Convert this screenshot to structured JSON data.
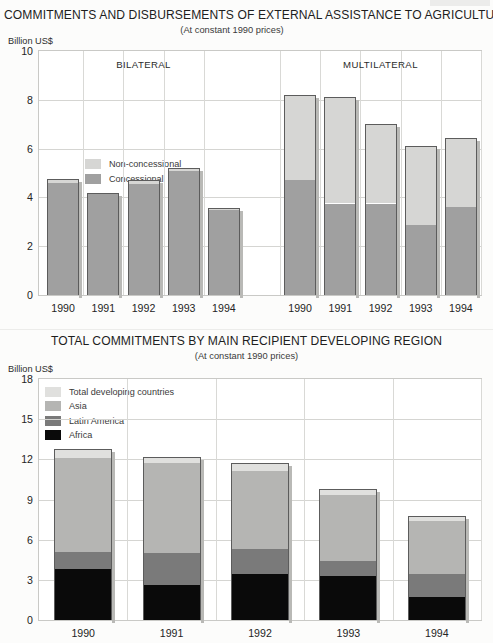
{
  "colors": {
    "non_concessional": "#d6d6d4",
    "concessional": "#a0a0a0",
    "total_developing": "#e0e0de",
    "asia": "#b5b5b3",
    "latin_america": "#7a7a7a",
    "africa": "#0a0a0a",
    "outline": "#5c5c5c",
    "grid": "#d5d5d2",
    "plot_border": "#c9c9c6"
  },
  "chart_data": [
    {
      "type": "bar",
      "title": "COMMITMENTS AND DISBURSEMENTS OF EXTERNAL ASSISTANCE TO AGRICULTURE*",
      "subtitle": "(At constant 1990 prices)",
      "ylabel": "Billion US$",
      "xlabel": "",
      "ylim": [
        0,
        10
      ],
      "yticks": [
        0,
        2,
        4,
        6,
        8,
        10
      ],
      "ytick_labels": [
        "0",
        "2",
        "4",
        "6",
        "8",
        "10"
      ],
      "grid": true,
      "legend_position": "inside-top-left",
      "stacked": true,
      "group_labels": [
        "BILATERAL",
        "MULTILATERAL"
      ],
      "categories": [
        "1990",
        "1991",
        "1992",
        "1993",
        "1994",
        "1990",
        "1991",
        "1992",
        "1993",
        "1994"
      ],
      "series": [
        {
          "name": "Concessional",
          "color": "#a0a0a0",
          "values": [
            4.6,
            4.15,
            4.55,
            5.1,
            3.5,
            4.7,
            3.75,
            3.75,
            2.85,
            3.6
          ]
        },
        {
          "name": "Non-concessional",
          "color": "#d6d6d4",
          "values": [
            0.15,
            0.05,
            0.15,
            0.1,
            0.05,
            3.5,
            4.35,
            3.25,
            3.25,
            2.85
          ]
        }
      ],
      "totals": [
        4.75,
        4.2,
        4.7,
        5.2,
        3.55,
        8.2,
        8.1,
        7.0,
        6.1,
        6.45
      ]
    },
    {
      "type": "bar",
      "title": "TOTAL COMMITMENTS BY MAIN RECIPIENT DEVELOPING REGION",
      "subtitle": "(At constant 1990 prices)",
      "ylabel": "Billion US$",
      "xlabel": "",
      "ylim": [
        0,
        18
      ],
      "yticks": [
        0,
        3,
        6,
        9,
        12,
        15,
        18
      ],
      "ytick_labels": [
        "0",
        "3",
        "6",
        "9",
        "12",
        "15",
        "18"
      ],
      "grid": true,
      "legend_position": "inside-top-left",
      "stacked": true,
      "categories": [
        "1990",
        "1991",
        "1992",
        "1993",
        "1994"
      ],
      "series": [
        {
          "name": "Africa",
          "color": "#0a0a0a",
          "values": [
            3.8,
            2.6,
            3.4,
            3.3,
            1.7
          ]
        },
        {
          "name": "Latin America",
          "color": "#7a7a7a",
          "values": [
            1.3,
            2.4,
            1.9,
            1.1,
            1.7
          ]
        },
        {
          "name": "Asia",
          "color": "#b5b5b3",
          "values": [
            7.0,
            6.7,
            5.8,
            4.9,
            4.0
          ]
        },
        {
          "name": "Total developing countries",
          "color": "#e0e0de",
          "values": [
            0.7,
            0.5,
            0.6,
            0.5,
            0.4
          ]
        }
      ],
      "totals": [
        12.8,
        12.2,
        11.7,
        9.8,
        7.8
      ]
    }
  ]
}
